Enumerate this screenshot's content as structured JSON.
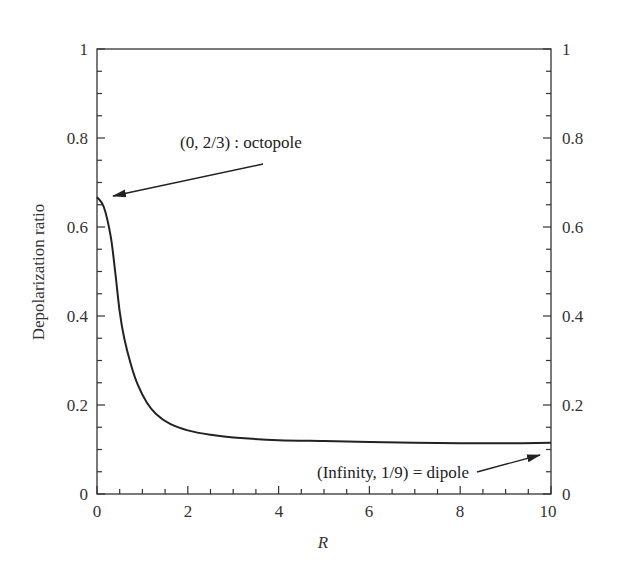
{
  "chart_data": {
    "type": "line",
    "title": "",
    "xlabel": "R",
    "ylabel": "Depolarization ratio",
    "xlim": [
      0,
      10
    ],
    "ylim": [
      0,
      1
    ],
    "grid": false,
    "legend": null,
    "x_ticks": [
      "0",
      "2",
      "4",
      "6",
      "8",
      "10"
    ],
    "y_ticks": [
      "0",
      "0.2",
      "0.4",
      "0.6",
      "0.8",
      "1"
    ],
    "y_ticks_right": [
      "0",
      "0.2",
      "0.4",
      "0.6",
      "0.8",
      "1"
    ],
    "series": [
      {
        "name": "Depolarization ratio vs R",
        "x": [
          0,
          0.15,
          0.3,
          0.4,
          0.5,
          0.6,
          0.75,
          0.9,
          1.1,
          1.3,
          1.6,
          2.0,
          2.5,
          3.0,
          4.0,
          5.0,
          6.0,
          7.0,
          8.0,
          9.0,
          10.0
        ],
        "y": [
          0.667,
          0.645,
          0.58,
          0.5,
          0.41,
          0.35,
          0.29,
          0.245,
          0.205,
          0.18,
          0.158,
          0.143,
          0.133,
          0.127,
          0.121,
          0.119,
          0.117,
          0.115,
          0.114,
          0.114,
          0.115
        ]
      }
    ],
    "annotations": [
      {
        "text": "(0, 2/3) : octopole",
        "points_to": [
          0,
          0.667
        ]
      },
      {
        "text": "(Infinity, 1/9) = dipole",
        "points_to": [
          10,
          0.111
        ]
      }
    ]
  },
  "labels": {
    "xlabel": "R",
    "ylabel": "Depolarization ratio",
    "annot_octopole": "(0, 2/3) : octopole",
    "annot_dipole": "(Infinity, 1/9) = dipole",
    "x0": "0",
    "x2": "2",
    "x4": "4",
    "x6": "6",
    "x8": "8",
    "x10": "10",
    "y0": "0",
    "y02": "0.2",
    "y04": "0.4",
    "y06": "0.6",
    "y08": "0.8",
    "y1": "1"
  }
}
